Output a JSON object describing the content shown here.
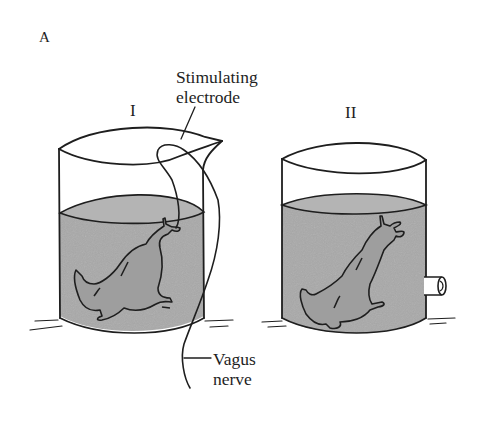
{
  "figure": {
    "panel_label": "A",
    "apparatus": [
      {
        "id": "I",
        "label": "I",
        "contents": "isolated frog heart preparation in fluid-filled beaker with spout",
        "has_electrode": true,
        "has_outlet_tube": false
      },
      {
        "id": "II",
        "label": "II",
        "contents": "isolated frog heart preparation in fluid-filled beaker",
        "has_electrode": false,
        "has_outlet_tube": true
      }
    ],
    "annotations": {
      "electrode_line1": "Stimulating",
      "electrode_line2": "electrode",
      "nerve_line1": "Vagus",
      "nerve_line2": "nerve"
    },
    "colors": {
      "ink": "#1e1e1e",
      "fluid": "#a9a9a9",
      "fluid_surface": "#bdbdbd",
      "background": "#ffffff"
    }
  }
}
